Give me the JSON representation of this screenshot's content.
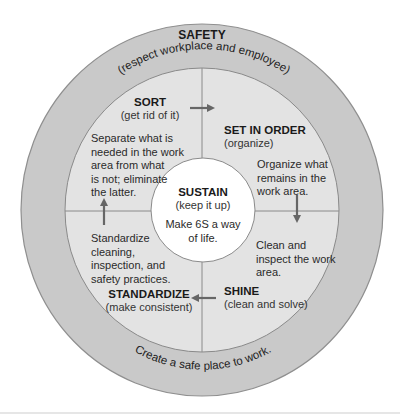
{
  "colors": {
    "outer_ring": "#c9c9c9",
    "outer_ring_stroke": "#8f8f8f",
    "inner_ring": "#e3e3e3",
    "inner_ring_stroke": "#8a8a8a",
    "center_circle": "#ffffff",
    "divider": "#8a8a8a",
    "arrow": "#666666",
    "text": "#222222"
  },
  "safety": {
    "title": "SAFETY",
    "subtitle": "(respect workplace and employee)",
    "footer": "Create a safe place to work."
  },
  "sections": {
    "sort": {
      "title": "SORT",
      "subtitle": "(get rid of it)",
      "description": [
        "Separate what is",
        "needed in the work",
        "area from what",
        "is not; eliminate",
        "the latter."
      ]
    },
    "set_in_order": {
      "title": "SET IN ORDER",
      "subtitle": "(organize)",
      "description": [
        "Organize what",
        "remains in the",
        "work area."
      ]
    },
    "shine": {
      "title": "SHINE",
      "subtitle": "(clean and solve)",
      "description": [
        "Clean and",
        "inspect the work",
        "area."
      ]
    },
    "standardize": {
      "title": "STANDARDIZE",
      "subtitle": "(make consistent)",
      "description": [
        "Standardize",
        "cleaning,",
        "inspection, and",
        "safety practices."
      ]
    },
    "sustain": {
      "title": "SUSTAIN",
      "subtitle": "(keep it up)",
      "description": [
        "Make 6S a way",
        "of life."
      ]
    }
  },
  "arrows": [
    {
      "name": "sort-to-set-in-order",
      "direction": "right"
    },
    {
      "name": "set-in-order-to-shine",
      "direction": "down"
    },
    {
      "name": "shine-to-standardize",
      "direction": "left"
    },
    {
      "name": "standardize-to-sort",
      "direction": "up"
    }
  ]
}
